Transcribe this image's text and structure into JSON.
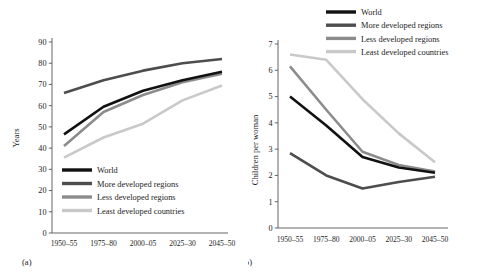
{
  "figure": {
    "panels": [
      {
        "panel_label": "(a)",
        "ylabel": "Years"
      },
      {
        "panel_label": "(b)",
        "ylabel": "Children per woman"
      }
    ]
  },
  "series_colors": {
    "world": "#111111",
    "more_developed": "#4d4d4d",
    "less_developed": "#8c8c8c",
    "least_developed": "#c9c9c9"
  },
  "legend": {
    "items": [
      {
        "label": "World",
        "color": "#111111"
      },
      {
        "label": "More developed regions",
        "color": "#4d4d4d"
      },
      {
        "label": "Less developed regions",
        "color": "#8c8c8c"
      },
      {
        "label": "Least developed countries",
        "color": "#c9c9c9"
      }
    ]
  },
  "chart_data": [
    {
      "type": "line",
      "title": "",
      "panel": "(a)",
      "xlabel": "",
      "ylabel": "Years",
      "categories": [
        "1950–55",
        "1975–80",
        "2000–05",
        "2025–30",
        "2045–50"
      ],
      "ylim": [
        0,
        90
      ],
      "yticks": [
        0,
        10,
        20,
        30,
        40,
        50,
        60,
        70,
        80,
        90
      ],
      "ytick_labels": [
        "0",
        "10",
        "20",
        "30",
        "40",
        "50",
        "60",
        "70",
        "80",
        "90"
      ],
      "grid": false,
      "legend_position": "inside-lower-center",
      "series": [
        {
          "name": "World",
          "color": "#111111",
          "values": [
            46.5,
            59.5,
            67.0,
            72.0,
            76.0
          ]
        },
        {
          "name": "More developed regions",
          "color": "#4d4d4d",
          "values": [
            66.0,
            72.0,
            76.5,
            80.0,
            82.0
          ]
        },
        {
          "name": "Less developed regions",
          "color": "#8c8c8c",
          "values": [
            41.0,
            57.0,
            65.0,
            71.0,
            75.0
          ]
        },
        {
          "name": "Least developed countries",
          "color": "#c9c9c9",
          "values": [
            35.5,
            45.0,
            51.5,
            62.5,
            69.5
          ]
        }
      ]
    },
    {
      "type": "line",
      "title": "",
      "panel": "(b)",
      "xlabel": "",
      "ylabel": "Children per woman",
      "categories": [
        "1950–55",
        "1975–80",
        "2000–05",
        "2025–30",
        "2045–50"
      ],
      "ylim": [
        0,
        7
      ],
      "yticks": [
        0,
        1,
        2,
        3,
        4,
        5,
        6,
        7
      ],
      "ytick_labels": [
        "0",
        "1",
        "2",
        "3",
        "4",
        "5",
        "6",
        "7"
      ],
      "grid": false,
      "legend_position": "above-upper-right",
      "series": [
        {
          "name": "World",
          "color": "#111111",
          "values": [
            5.0,
            3.9,
            2.7,
            2.3,
            2.1
          ]
        },
        {
          "name": "More developed regions",
          "color": "#4d4d4d",
          "values": [
            2.85,
            2.0,
            1.5,
            1.75,
            1.95
          ]
        },
        {
          "name": "Less developed regions",
          "color": "#8c8c8c",
          "values": [
            6.15,
            4.5,
            2.9,
            2.4,
            2.15
          ]
        },
        {
          "name": "Least developed countries",
          "color": "#c9c9c9",
          "values": [
            6.6,
            6.4,
            4.9,
            3.6,
            2.5
          ]
        }
      ]
    }
  ]
}
